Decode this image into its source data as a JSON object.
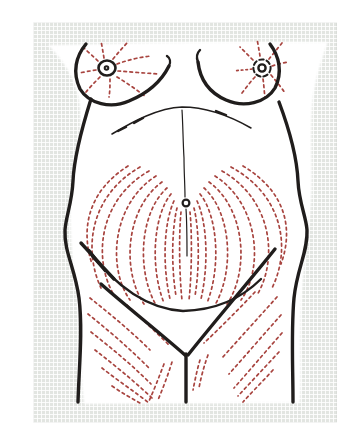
{
  "page": {
    "background_color": "#ffffff"
  },
  "backdrop": {
    "color": "#e2e5e1",
    "texture": "woven-grid-paper"
  },
  "illustration": {
    "subject": "anterior-torso-skin-tension-lines",
    "paper_color": "#ffffff",
    "ink_color": "#201d1c",
    "tension_line_color": "#a8443f",
    "parts": [
      "left-breast-outline",
      "right-breast-outline",
      "left-nipple-areola",
      "right-nipple-areola",
      "nipple-tension-lines-left",
      "nipple-tension-lines-right",
      "costal-margin-line",
      "abdominal-midline",
      "umbilicus",
      "umbilical-tension-lines",
      "suprapubic-crease",
      "left-hip-crease",
      "left-inguinal-fold",
      "right-inguinal-fold",
      "pubic-midline",
      "thigh-tension-lines-left",
      "thigh-tension-lines-right"
    ]
  }
}
